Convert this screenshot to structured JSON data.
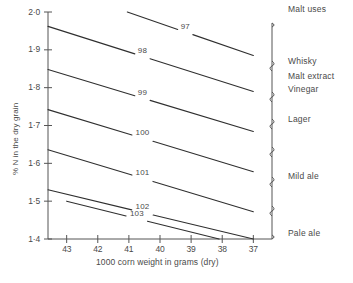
{
  "chart_data": {
    "type": "line",
    "title": "",
    "xlabel": "1000 corn weight in grams  (dry)",
    "ylabel": "% N in the dry grain",
    "xlim": [
      43.6,
      36.4
    ],
    "ylim": [
      1.4,
      2.0
    ],
    "x_ticks": [
      "43",
      "42",
      "41",
      "40",
      "39",
      "38",
      "37"
    ],
    "x_tick_values": [
      43,
      42,
      41,
      40,
      39,
      38,
      37
    ],
    "y_ticks": [
      "1·4",
      "1·5",
      "1·6",
      "1·7",
      "1·8",
      "1·9",
      "2·0"
    ],
    "y_tick_values": [
      1.4,
      1.5,
      1.6,
      1.7,
      1.8,
      1.9,
      2.0
    ],
    "grid": false,
    "legend": "none",
    "note": "Iso-extract contour lines; each labelled line is a constant hot water extract value",
    "series": [
      {
        "name": "97",
        "label": "97",
        "x": [
          41.05,
          37.0
        ],
        "y": [
          2.0,
          1.885
        ]
      },
      {
        "name": "98",
        "label": "98",
        "x": [
          43.6,
          37.0
        ],
        "y": [
          1.962,
          1.79
        ]
      },
      {
        "name": "99",
        "label": "99",
        "x": [
          43.6,
          37.0
        ],
        "y": [
          1.848,
          1.684
        ]
      },
      {
        "name": "100",
        "label": "100",
        "x": [
          43.6,
          37.0
        ],
        "y": [
          1.742,
          1.578
        ]
      },
      {
        "name": "101",
        "label": "101",
        "x": [
          43.6,
          37.0
        ],
        "y": [
          1.636,
          1.472
        ]
      },
      {
        "name": "102",
        "label": "102",
        "x": [
          43.6,
          37.0
        ],
        "y": [
          1.53,
          1.4
        ]
      },
      {
        "name": "103",
        "label": "103",
        "x": [
          43.0,
          38.1
        ],
        "y": [
          1.5,
          1.4
        ]
      }
    ]
  },
  "right_panel": {
    "header": "Malt uses",
    "groups": [
      {
        "label": "Whisky"
      },
      {
        "label": "Malt extract"
      },
      {
        "label": "Vinegar"
      },
      {
        "label": "Lager"
      },
      {
        "label": "Mild ale"
      },
      {
        "label": "Pale ale"
      }
    ]
  },
  "caption": {
    "text": ""
  },
  "colors": {
    "ink": "#3a3a3a",
    "axis": "#555555",
    "line": "#2f2f2f",
    "paper": "#ffffff"
  }
}
